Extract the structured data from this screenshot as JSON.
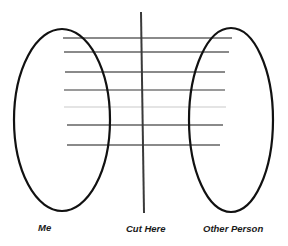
{
  "diagram": {
    "title": "",
    "labels": {
      "left": "Me",
      "center": "Cut Here",
      "right": "Other Person"
    },
    "nodes": [
      {
        "id": "me",
        "shape": "ellipse",
        "label": "Me",
        "cx": 62,
        "cy": 120,
        "rx": 48,
        "ry": 91
      },
      {
        "id": "other-person",
        "shape": "ellipse",
        "label": "Other Person",
        "cx": 231,
        "cy": 120,
        "rx": 42,
        "ry": 92
      }
    ],
    "cut_line": {
      "label": "Cut Here",
      "x1": 141,
      "y1": 12,
      "x2": 144,
      "y2": 213,
      "color": "#3a3a3a"
    },
    "connections": [
      {
        "x1": 63,
        "y1": 38,
        "x2": 232,
        "y2": 38,
        "color": "#8a8a8a"
      },
      {
        "x1": 64,
        "y1": 52,
        "x2": 229,
        "y2": 52,
        "color": "#8a8a8a"
      },
      {
        "x1": 65,
        "y1": 72,
        "x2": 225,
        "y2": 72,
        "color": "#8a8a8a"
      },
      {
        "x1": 64,
        "y1": 90,
        "x2": 225,
        "y2": 90,
        "color": "#9a9a9a"
      },
      {
        "x1": 64,
        "y1": 107,
        "x2": 226,
        "y2": 107,
        "color": "#e4e4e4"
      },
      {
        "x1": 67,
        "y1": 125,
        "x2": 223,
        "y2": 125,
        "color": "#8a8a8a"
      },
      {
        "x1": 67,
        "y1": 145,
        "x2": 220,
        "y2": 145,
        "color": "#8a8a8a"
      }
    ],
    "colors": {
      "ellipse_stroke": "#111111",
      "background": "#ffffff",
      "text": "#1a1a1a"
    }
  }
}
